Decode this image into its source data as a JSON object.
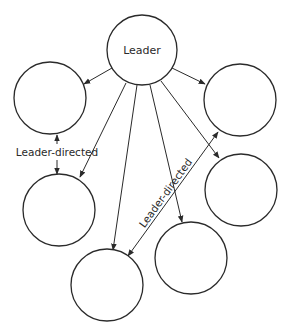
{
  "diagram": {
    "type": "leadership-network",
    "colors": {
      "stroke": "#2a2a2a",
      "background": "#ffffff"
    },
    "nodes": [
      {
        "id": "leader",
        "label": "Leader",
        "cx": 142,
        "cy": 50,
        "r": 35
      },
      {
        "id": "member-top-left",
        "label": "",
        "cx": 50,
        "cy": 98,
        "r": 36
      },
      {
        "id": "member-top-right",
        "label": "",
        "cx": 240,
        "cy": 100,
        "r": 36
      },
      {
        "id": "member-left-middle",
        "label": "",
        "cx": 59,
        "cy": 210,
        "r": 36
      },
      {
        "id": "member-right-middle",
        "label": "",
        "cx": 241,
        "cy": 190,
        "r": 36
      },
      {
        "id": "member-bottom-left",
        "label": "",
        "cx": 107,
        "cy": 285,
        "r": 36
      },
      {
        "id": "member-bottom-right",
        "label": "",
        "cx": 191,
        "cy": 258,
        "r": 36
      }
    ],
    "edges": [
      {
        "from": "leader",
        "to": "member-top-left",
        "x1": 112,
        "y1": 68,
        "x2": 84,
        "y2": 84,
        "direction": "forward"
      },
      {
        "from": "leader",
        "to": "member-top-right",
        "x1": 172,
        "y1": 68,
        "x2": 205,
        "y2": 84,
        "direction": "forward"
      },
      {
        "from": "leader",
        "to": "member-left-middle",
        "x1": 126,
        "y1": 83,
        "x2": 80,
        "y2": 177,
        "direction": "forward"
      },
      {
        "from": "leader",
        "to": "member-bottom-left",
        "x1": 137,
        "y1": 85,
        "x2": 113,
        "y2": 250,
        "direction": "forward"
      },
      {
        "from": "leader",
        "to": "member-bottom-right",
        "x1": 150,
        "y1": 85,
        "x2": 182,
        "y2": 222,
        "direction": "forward"
      },
      {
        "from": "leader",
        "to": "member-right-middle",
        "x1": 161,
        "y1": 81,
        "x2": 219,
        "y2": 158,
        "direction": "forward"
      },
      {
        "from": "member-top-left",
        "to": "member-left-middle",
        "x1": 56,
        "y1": 135,
        "x2": 57,
        "y2": 174,
        "direction": "both",
        "label": "Leader-directed"
      },
      {
        "from": "member-bottom-left",
        "to": "member-top-right",
        "x1": 128,
        "y1": 256,
        "x2": 218,
        "y2": 132,
        "direction": "both",
        "label": "Leader-directed"
      }
    ],
    "edge_labels": {
      "left": "Leader-directed",
      "diagonal": "Leader-directed"
    }
  }
}
